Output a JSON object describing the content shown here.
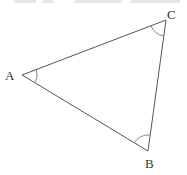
{
  "diagram": {
    "type": "triangle",
    "vertices": [
      {
        "label": "A",
        "x": 22,
        "y": 75
      },
      {
        "label": "B",
        "x": 148,
        "y": 151
      },
      {
        "label": "C",
        "x": 166,
        "y": 20
      }
    ],
    "angle_marks": [
      "A",
      "B",
      "C"
    ],
    "colors": {
      "line": "#555555",
      "text": "#333333",
      "background": "#ffffff"
    }
  },
  "labels": {
    "a": "A",
    "b": "B",
    "c": "C"
  }
}
